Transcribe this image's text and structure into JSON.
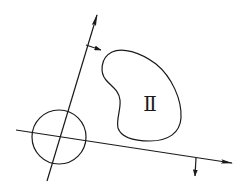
{
  "diagram": {
    "region_label": "Ⅱ",
    "colors": {
      "background": "#ffffff",
      "ink": "#1a1a1a"
    },
    "elements": {
      "tilted_axis": {
        "from": [
          47,
          181
        ],
        "to": [
          97,
          15
        ],
        "arrowhead": true
      },
      "tilted_axis_normal_arrow": {
        "from": [
          86,
          45
        ],
        "to": [
          101,
          50
        ]
      },
      "horizontal_axis": {
        "from": [
          16,
          130
        ],
        "to": [
          232,
          163
        ],
        "arrowhead": true
      },
      "horizontal_axis_normal_arrow": {
        "from": [
          196,
          158
        ],
        "to": [
          195,
          176
        ]
      },
      "circle": {
        "cx": 59,
        "cy": 137,
        "r": 27
      },
      "region_outline": "closed kidney-shaped curve",
      "label_position": [
        150,
        104
      ]
    }
  }
}
